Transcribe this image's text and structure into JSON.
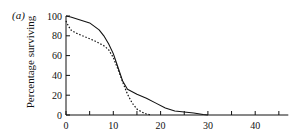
{
  "chart_data": {
    "type": "line",
    "panel_label": "(a)",
    "title": "",
    "xlabel": "",
    "ylabel": "Percentage surviving",
    "xlim": [
      0,
      47
    ],
    "ylim": [
      0,
      100
    ],
    "x_ticks": [
      0,
      5,
      10,
      15,
      20,
      25,
      30,
      35,
      40,
      45
    ],
    "x_tick_labels": [
      "0",
      "10",
      "20",
      "30",
      "40"
    ],
    "x_tick_label_values": [
      0,
      10,
      20,
      30,
      40
    ],
    "y_ticks": [
      0,
      20,
      40,
      60,
      80,
      100
    ],
    "y_tick_labels": [
      "0",
      "20",
      "40",
      "60",
      "80",
      "100"
    ],
    "grid": false,
    "legend": null,
    "series": [
      {
        "name": "solid",
        "style": "solid",
        "x": [
          0,
          1,
          3,
          5,
          7,
          8,
          9,
          10,
          11,
          12,
          13,
          15,
          17,
          19,
          21,
          23,
          25,
          27,
          29,
          30
        ],
        "y": [
          100,
          99,
          96,
          93,
          86,
          80,
          72,
          62,
          48,
          34,
          26,
          21,
          17,
          12,
          7,
          4,
          3,
          2,
          0.5,
          0
        ]
      },
      {
        "name": "dotted",
        "style": "dotted",
        "x": [
          0,
          0.5,
          1,
          2,
          4,
          6,
          8,
          9,
          10,
          11,
          12,
          13,
          14,
          15,
          16,
          17,
          18
        ],
        "y": [
          95,
          90,
          86,
          83,
          79,
          75,
          70,
          66,
          58,
          46,
          33,
          21,
          12,
          6,
          3,
          1,
          0
        ]
      }
    ]
  }
}
